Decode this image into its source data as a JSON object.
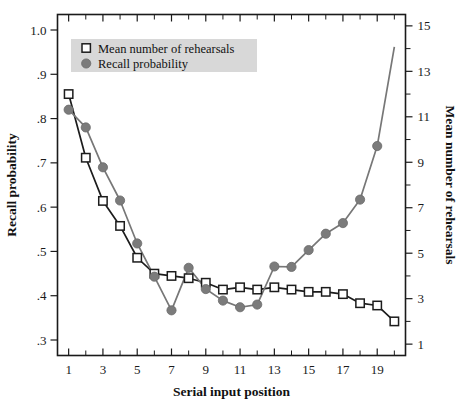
{
  "chart_data": {
    "type": "line",
    "title": "",
    "xlabel": "Serial input position",
    "ylabel": "Recall probability",
    "y2label": "Mean number of rehearsals",
    "x": [
      1,
      2,
      3,
      4,
      5,
      6,
      7,
      8,
      9,
      10,
      11,
      12,
      13,
      14,
      15,
      16,
      17,
      18,
      19,
      20
    ],
    "xlim": [
      0.35,
      20.65
    ],
    "xticks": [
      1,
      2,
      3,
      4,
      5,
      6,
      7,
      8,
      9,
      10,
      11,
      12,
      13,
      14,
      15,
      16,
      17,
      18,
      19,
      20
    ],
    "xticklabels": [
      "1",
      "",
      "3",
      "",
      "5",
      "",
      "7",
      "",
      "9",
      "",
      "11",
      "",
      "13",
      "",
      "15",
      "",
      "17",
      "",
      "19",
      ""
    ],
    "ylim": [
      0.265,
      1.035
    ],
    "yticks": [
      0.3,
      0.4,
      0.5,
      0.6,
      0.7,
      0.8,
      0.9,
      1.0
    ],
    "yticklabels": [
      ".3",
      ".4",
      ".5",
      ".6",
      ".7",
      ".8",
      ".9",
      "1.0"
    ],
    "y2lim": [
      0.5,
      15.5
    ],
    "y2ticks": [
      1,
      2,
      3,
      4,
      5,
      6,
      7,
      8,
      9,
      10,
      11,
      12,
      13,
      14,
      15
    ],
    "y2ticklabels": [
      "1",
      "",
      "3",
      "",
      "5",
      "",
      "7",
      "",
      "9",
      "",
      "11",
      "",
      "13",
      "",
      "15"
    ],
    "grid": false,
    "legend_position": "top-left",
    "series": [
      {
        "name": "Mean number of rehearsals",
        "axis": "right",
        "marker": "open-square",
        "color": "#1c1c1c",
        "values": [
          12.0,
          9.2,
          7.3,
          6.2,
          4.8,
          4.1,
          4.0,
          3.9,
          3.7,
          3.4,
          3.5,
          3.4,
          3.5,
          3.4,
          3.3,
          3.3,
          3.2,
          2.8,
          2.7,
          2.0
        ]
      },
      {
        "name": "Recall probability",
        "axis": "left",
        "marker": "filled-circle",
        "color": "#7b7b7b",
        "values": [
          0.82,
          0.78,
          0.69,
          0.615,
          0.518,
          0.443,
          0.367,
          0.463,
          0.415,
          0.389,
          0.374,
          0.38,
          0.466,
          0.465,
          0.503,
          0.54,
          0.564,
          0.617,
          0.738,
          0.962
        ],
        "last_point_marker_hidden": true
      }
    ]
  },
  "legend": {
    "entries": [
      {
        "label": "Mean number of rehearsals",
        "marker": "open-square"
      },
      {
        "label": "Recall probability",
        "marker": "filled-circle"
      }
    ],
    "background_color": "#d8d8d8"
  },
  "axes": {
    "left_title": "Recall probability",
    "right_title": "Mean number of rehearsals",
    "bottom_title": "Serial input position"
  },
  "colors": {
    "rehearsal_series": "#1c1c1c",
    "recall_series": "#7b7b7b",
    "axis": "#1a1a1a",
    "background": "#ffffff"
  }
}
